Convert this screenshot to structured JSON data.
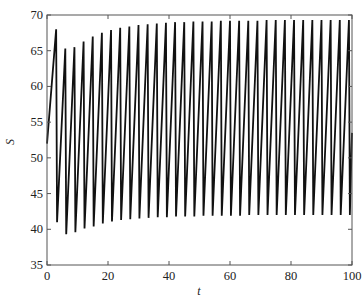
{
  "chart_data": {
    "type": "line",
    "title": "",
    "xlabel": "t",
    "ylabel": "S",
    "xlim": [
      0,
      100
    ],
    "ylim": [
      35,
      70
    ],
    "xticks": [
      0,
      20,
      40,
      60,
      80,
      100
    ],
    "yticks": [
      35,
      40,
      45,
      50,
      55,
      60,
      65,
      70
    ],
    "grid": false,
    "legend": null,
    "line_color": "#111111",
    "series": [
      {
        "name": "S(t)",
        "start": {
          "t": 0,
          "S": 52
        },
        "extrema": [
          {
            "t": 3.0,
            "S": 68.0
          },
          {
            "t": 3.3,
            "S": 41.0
          },
          {
            "t": 6.0,
            "S": 65.3
          },
          {
            "t": 6.3,
            "S": 39.3
          },
          {
            "t": 9.0,
            "S": 65.5
          },
          {
            "t": 9.3,
            "S": 39.6
          },
          {
            "t": 12.0,
            "S": 66.3
          },
          {
            "t": 12.3,
            "S": 40.1
          },
          {
            "t": 15.0,
            "S": 67.0
          },
          {
            "t": 15.3,
            "S": 40.4
          },
          {
            "t": 18.0,
            "S": 67.5
          },
          {
            "t": 18.3,
            "S": 40.8
          },
          {
            "t": 21.0,
            "S": 67.9
          },
          {
            "t": 21.3,
            "S": 41.1
          },
          {
            "t": 24.0,
            "S": 68.2
          },
          {
            "t": 24.3,
            "S": 41.3
          },
          {
            "t": 27.0,
            "S": 68.4
          },
          {
            "t": 27.3,
            "S": 41.4
          },
          {
            "t": 30.0,
            "S": 68.6
          },
          {
            "t": 30.3,
            "S": 41.5
          },
          {
            "t": 33.0,
            "S": 68.7
          },
          {
            "t": 33.3,
            "S": 41.6
          },
          {
            "t": 36.0,
            "S": 68.8
          },
          {
            "t": 36.3,
            "S": 41.7
          },
          {
            "t": 39.0,
            "S": 68.9
          },
          {
            "t": 39.3,
            "S": 41.7
          },
          {
            "t": 42.0,
            "S": 69.0
          },
          {
            "t": 42.3,
            "S": 41.8
          },
          {
            "t": 45.0,
            "S": 69.0
          },
          {
            "t": 45.3,
            "S": 41.8
          },
          {
            "t": 48.0,
            "S": 69.1
          },
          {
            "t": 48.3,
            "S": 41.8
          },
          {
            "t": 51.0,
            "S": 69.1
          },
          {
            "t": 51.3,
            "S": 41.9
          },
          {
            "t": 54.0,
            "S": 69.1
          },
          {
            "t": 54.3,
            "S": 41.9
          },
          {
            "t": 57.0,
            "S": 69.2
          },
          {
            "t": 57.3,
            "S": 41.9
          },
          {
            "t": 60.0,
            "S": 69.2
          },
          {
            "t": 60.3,
            "S": 41.9
          },
          {
            "t": 63.0,
            "S": 69.2
          },
          {
            "t": 63.3,
            "S": 41.9
          },
          {
            "t": 66.0,
            "S": 69.2
          },
          {
            "t": 66.3,
            "S": 42.0
          },
          {
            "t": 69.0,
            "S": 69.2
          },
          {
            "t": 69.3,
            "S": 42.0
          },
          {
            "t": 72.0,
            "S": 69.3
          },
          {
            "t": 72.3,
            "S": 42.0
          },
          {
            "t": 75.0,
            "S": 69.3
          },
          {
            "t": 75.3,
            "S": 42.0
          },
          {
            "t": 78.0,
            "S": 69.3
          },
          {
            "t": 78.3,
            "S": 42.0
          },
          {
            "t": 81.0,
            "S": 69.3
          },
          {
            "t": 81.3,
            "S": 42.0
          },
          {
            "t": 84.0,
            "S": 69.3
          },
          {
            "t": 84.3,
            "S": 42.0
          },
          {
            "t": 87.0,
            "S": 69.3
          },
          {
            "t": 87.3,
            "S": 42.0
          },
          {
            "t": 90.0,
            "S": 69.3
          },
          {
            "t": 90.3,
            "S": 42.0
          },
          {
            "t": 93.0,
            "S": 69.3
          },
          {
            "t": 93.3,
            "S": 42.0
          },
          {
            "t": 96.0,
            "S": 69.3
          },
          {
            "t": 96.3,
            "S": 42.0
          },
          {
            "t": 99.0,
            "S": 69.3
          },
          {
            "t": 99.3,
            "S": 42.0
          }
        ],
        "end": {
          "t": 100,
          "S": 53.5
        }
      }
    ]
  },
  "plot_area": {
    "left": 47,
    "top": 15,
    "right": 352,
    "bottom": 265
  }
}
